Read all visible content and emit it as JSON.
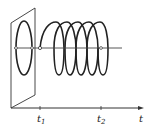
{
  "diagram": {
    "axis": {
      "label": "t"
    },
    "ticks": [
      {
        "label": "t",
        "subscript": "1"
      },
      {
        "label": "t",
        "subscript": "2"
      }
    ],
    "colors": {
      "stroke": "#222222",
      "background": "#ffffff"
    }
  }
}
